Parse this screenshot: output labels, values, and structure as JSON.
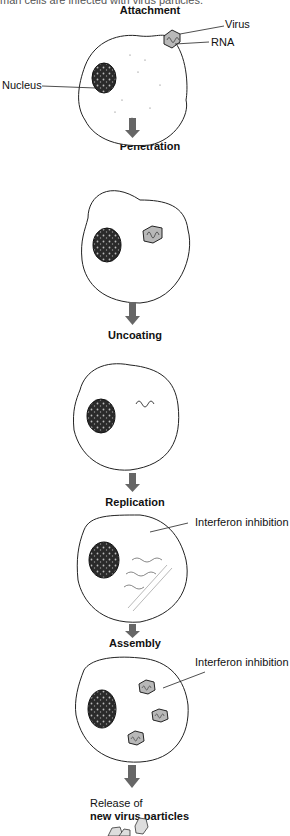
{
  "caption": "man cells are infected with virus particles.",
  "stages": [
    {
      "title": "Attachment"
    },
    {
      "title": "Penetration"
    },
    {
      "title": "Uncoating"
    },
    {
      "title": "Replication"
    },
    {
      "title": "Assembly"
    },
    {
      "title_line1": "Release of",
      "title_line2": "new virus particles"
    }
  ],
  "labels": {
    "virus": "Virus",
    "rna": "RNA",
    "nucleus": "Nucleus",
    "interferon_1": "Interferon inhibition",
    "interferon_2": "Interferon inhibition"
  },
  "colors": {
    "arrow": "#666666",
    "nucleus": "#2a2a2a",
    "virus_fill": "#b8b8b8",
    "outline": "#222222"
  }
}
